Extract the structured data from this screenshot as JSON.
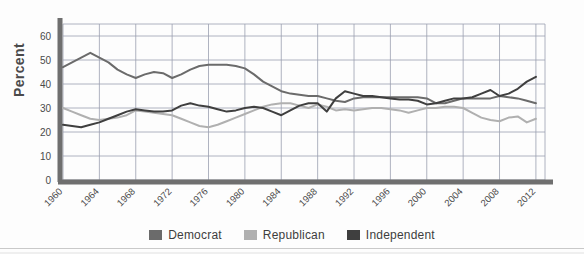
{
  "page": {
    "title_partial": "",
    "background_color": "#fdfdfd"
  },
  "chart_data": {
    "type": "line",
    "title": "",
    "xlabel": "",
    "ylabel": "Percent",
    "ylim": [
      0,
      65
    ],
    "xlim": [
      1960,
      2013
    ],
    "grid": true,
    "legend_position": "bottom",
    "ytick_labels": [
      "0",
      "10",
      "20",
      "30",
      "40",
      "50",
      "60"
    ],
    "ytick_values": [
      0,
      10,
      20,
      30,
      40,
      50,
      60
    ],
    "xtick_labels": [
      "1960",
      "1964",
      "1968",
      "1972",
      "1976",
      "1980",
      "1984",
      "1988",
      "1992",
      "1996",
      "2000",
      "2004",
      "2008",
      "2012"
    ],
    "xtick_values": [
      1960,
      1964,
      1968,
      1972,
      1976,
      1980,
      1984,
      1988,
      1992,
      1996,
      2000,
      2004,
      2008,
      2012
    ],
    "x": [
      1960,
      1961,
      1962,
      1963,
      1964,
      1965,
      1966,
      1967,
      1968,
      1969,
      1970,
      1971,
      1972,
      1973,
      1974,
      1975,
      1976,
      1977,
      1978,
      1979,
      1980,
      1981,
      1982,
      1983,
      1984,
      1985,
      1986,
      1987,
      1988,
      1989,
      1990,
      1991,
      1992,
      1993,
      1994,
      1995,
      1996,
      1997,
      1998,
      1999,
      2000,
      2001,
      2002,
      2003,
      2004,
      2005,
      2006,
      2007,
      2008,
      2009,
      2010,
      2011,
      2012
    ],
    "series": [
      {
        "name": "Democrat",
        "color": "#6b6b6b",
        "values": [
          47,
          49,
          51,
          53,
          51,
          49,
          46,
          44,
          42.5,
          44,
          45,
          44.5,
          42.5,
          44,
          46,
          47.5,
          48,
          48,
          48,
          47.5,
          46.5,
          44,
          41,
          39,
          37,
          36,
          35.5,
          35,
          35,
          34,
          33,
          32.5,
          34,
          34.5,
          34.5,
          34.5,
          34.5,
          34.5,
          34.5,
          34.5,
          34,
          32,
          32,
          33,
          34,
          34,
          34,
          34,
          35,
          34.5,
          34,
          33,
          32
        ]
      },
      {
        "name": "Republican",
        "color": "#b0b0b0",
        "values": [
          30,
          28.5,
          27,
          25.5,
          25,
          25.5,
          26,
          27,
          29,
          28.5,
          28,
          27.5,
          27,
          25.5,
          24,
          22.5,
          22,
          23,
          24.5,
          26,
          27.5,
          29,
          30.5,
          31.5,
          32,
          32,
          31,
          30,
          31.5,
          30.5,
          29,
          29.5,
          29,
          29.5,
          30,
          30,
          29.5,
          29,
          28,
          29,
          30,
          30,
          30.5,
          30.5,
          30,
          28,
          26,
          25,
          24.5,
          26,
          26.5,
          24,
          25.5
        ]
      },
      {
        "name": "Independent",
        "color": "#3f3f3f",
        "values": [
          23,
          22.5,
          22,
          23,
          24,
          25.5,
          27,
          28.5,
          29.5,
          29,
          28.5,
          28.5,
          29,
          31,
          32,
          31,
          30.5,
          29.5,
          28.5,
          29,
          30,
          30.5,
          30,
          28.5,
          27,
          29,
          31,
          32,
          32,
          28.5,
          34,
          37,
          36,
          35,
          35,
          34.5,
          34,
          33.5,
          33.5,
          33,
          31.5,
          32,
          33,
          34,
          34,
          34.5,
          36,
          37.5,
          35,
          36,
          38,
          41,
          43
        ]
      }
    ]
  },
  "legend": {
    "items": [
      {
        "label": "Democrat",
        "color": "#6b6b6b"
      },
      {
        "label": "Republican",
        "color": "#b0b0b0"
      },
      {
        "label": "Independent",
        "color": "#3f3f3f"
      }
    ]
  }
}
